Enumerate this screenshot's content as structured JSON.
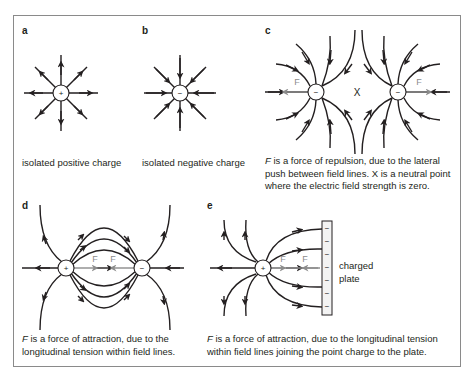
{
  "figure": {
    "panels": [
      {
        "id": "a",
        "label": "a",
        "caption": "isolated positive charge",
        "charge": "+"
      },
      {
        "id": "b",
        "label": "b",
        "caption": "isolated negative charge",
        "charge": "−"
      },
      {
        "id": "c",
        "label": "c",
        "caption_prefix": "F",
        "caption": " is a force of repulsion, due to the lateral push between field lines. X is a neutral point where the electric field strength is zero.",
        "charges": [
          "−",
          "−"
        ],
        "neutral_point": "X",
        "force_label": "F"
      },
      {
        "id": "d",
        "label": "d",
        "caption_prefix": "F",
        "caption": " is a force of attraction, due to the longitudinal tension within field lines.",
        "charges": [
          "+",
          "−"
        ],
        "force_label": "F"
      },
      {
        "id": "e",
        "label": "e",
        "caption_prefix": "F",
        "caption": " is a force of attraction, due to the longitudinal tension within field lines joining the point charge to the plate.",
        "charges": [
          "+"
        ],
        "force_label": "F",
        "plate_label_1": "charged",
        "plate_label_2": "plate",
        "plate_charge": "−"
      }
    ],
    "colors": {
      "line": "#231f20",
      "force": "#8c8c8c",
      "border": "#8a8a8a"
    }
  }
}
